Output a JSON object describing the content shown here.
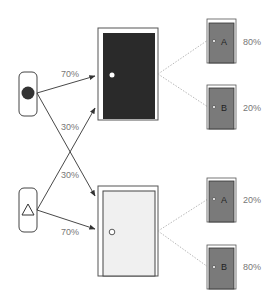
{
  "diagram": {
    "cues": [
      {
        "id": "circle",
        "shape": "filled-circle"
      },
      {
        "id": "triangle",
        "shape": "outlined-triangle"
      }
    ],
    "arrows": {
      "circle_to_dark": "70%",
      "circle_to_light": "30%",
      "triangle_to_dark": "30%",
      "triangle_to_light": "70%"
    },
    "big_doors": [
      {
        "id": "dark-door",
        "fill": "#2a2a2a",
        "knob": "#ffffff"
      },
      {
        "id": "light-door",
        "fill": "#f0f0f0",
        "knob": "#ffffff"
      }
    ],
    "small_doors": [
      {
        "group": "dark",
        "letter": "A",
        "probability": "80%"
      },
      {
        "group": "dark",
        "letter": "B",
        "probability": "20%"
      },
      {
        "group": "light",
        "letter": "A",
        "probability": "20%"
      },
      {
        "group": "light",
        "letter": "B",
        "probability": "80%"
      }
    ],
    "colors": {
      "line": "#444444",
      "dotted": "#999999",
      "small_door_fill": "#7a7a7a",
      "label": "#777777"
    }
  }
}
